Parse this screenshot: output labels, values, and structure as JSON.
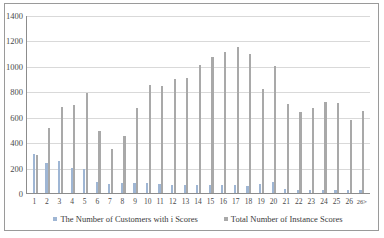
{
  "chart_data": {
    "type": "bar",
    "title": "",
    "xlabel": "",
    "ylabel": "",
    "ylim": [
      0,
      1400
    ],
    "yticks": [
      0,
      200,
      400,
      600,
      800,
      1000,
      1200,
      1400
    ],
    "grid": true,
    "legend_position": "bottom",
    "categories": [
      "1",
      "2",
      "3",
      "4",
      "5",
      "6",
      "7",
      "8",
      "9",
      "10",
      "11",
      "12",
      "13",
      "14",
      "15",
      "16",
      "17",
      "18",
      "19",
      "20",
      "21",
      "22",
      "23",
      "24",
      "25",
      "26",
      "26>"
    ],
    "series": [
      {
        "name": "The Number of Customers with i Scores",
        "color": "#9fb6d4",
        "values": [
          310,
          235,
          255,
          200,
          185,
          85,
          70,
          80,
          75,
          75,
          70,
          65,
          65,
          60,
          60,
          60,
          60,
          55,
          70,
          90,
          30,
          25,
          25,
          25,
          25,
          20,
          20
        ]
      },
      {
        "name": "Total Number of Instance Scores",
        "color": "#a9a9a9",
        "values": [
          300,
          510,
          680,
          690,
          790,
          490,
          345,
          445,
          665,
          850,
          845,
          895,
          905,
          1010,
          1070,
          1110,
          1150,
          1090,
          815,
          1000,
          700,
          640,
          665,
          715,
          710,
          575,
          645
        ]
      }
    ]
  },
  "legend": {
    "items": [
      {
        "label": "The Number of Customers with i Scores"
      },
      {
        "label": "Total Number of Instance Scores"
      }
    ]
  }
}
